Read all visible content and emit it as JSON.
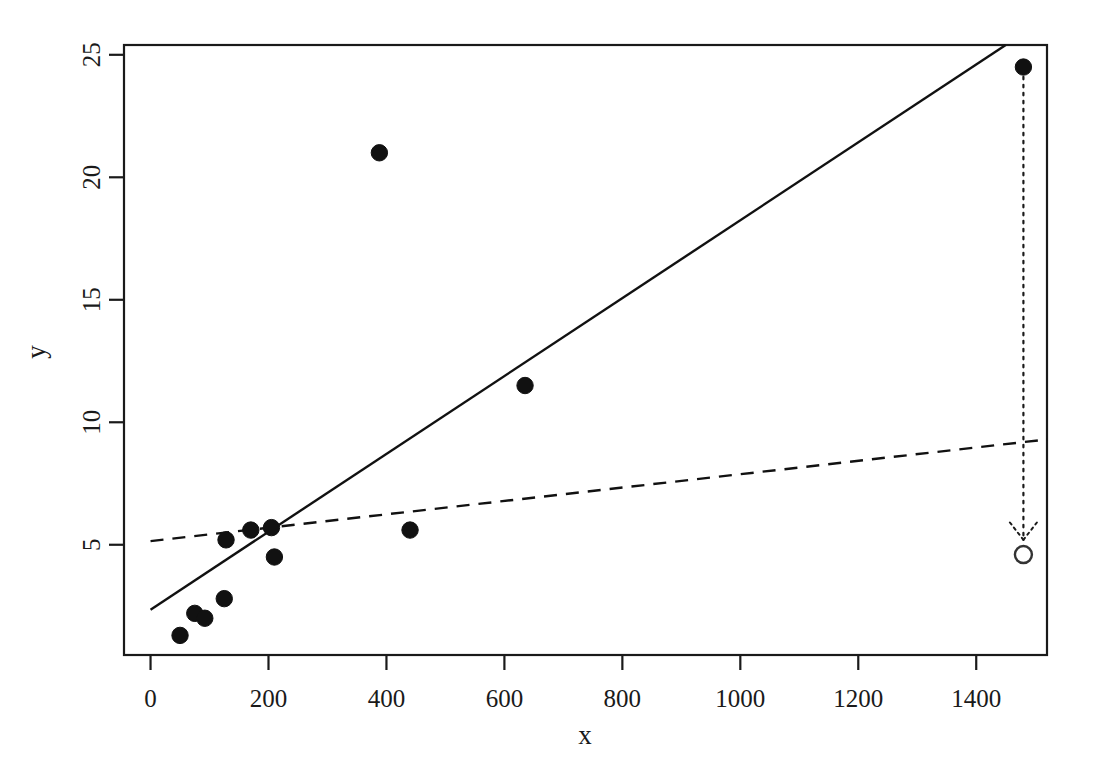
{
  "figure": {
    "kind": "scatter-plot-with-regression-lines",
    "background_color": "#ffffff",
    "foreground_color": "#1a1a1a",
    "width": 1096,
    "height": 777
  },
  "axes": {
    "x_label": "x",
    "y_label": "y",
    "x_ticks": [
      "0",
      "200",
      "400",
      "600",
      "800",
      "1000",
      "1200",
      "1400"
    ],
    "y_ticks": [
      "5",
      "10",
      "15",
      "20",
      "25"
    ],
    "box": true,
    "grid": false
  },
  "chart_data": {
    "type": "scatter",
    "title": "",
    "xlabel": "x",
    "ylabel": "y",
    "xlim": [
      -45,
      1520
    ],
    "ylim": [
      0.5,
      25.4
    ],
    "xticks": [
      0,
      200,
      400,
      600,
      800,
      1000,
      1200,
      1400
    ],
    "yticks": [
      5,
      10,
      15,
      20,
      25
    ],
    "grid": false,
    "legend": "none",
    "series": [
      {
        "name": "observations",
        "marker": "filled-circle",
        "color": "#111111",
        "points": [
          {
            "x": 50,
            "y": 1.3
          },
          {
            "x": 75,
            "y": 2.2
          },
          {
            "x": 92,
            "y": 2.0
          },
          {
            "x": 125,
            "y": 2.8
          },
          {
            "x": 128,
            "y": 5.2
          },
          {
            "x": 170,
            "y": 5.6
          },
          {
            "x": 205,
            "y": 5.7
          },
          {
            "x": 210,
            "y": 4.5
          },
          {
            "x": 388,
            "y": 21.0
          },
          {
            "x": 440,
            "y": 5.6
          },
          {
            "x": 635,
            "y": 11.5
          },
          {
            "x": 1480,
            "y": 24.5
          }
        ]
      },
      {
        "name": "moved-point",
        "marker": "open-circle",
        "color": "#333333",
        "points": [
          {
            "x": 1480,
            "y": 4.6
          }
        ]
      }
    ],
    "lines": [
      {
        "name": "solid-regression-line",
        "style": "solid",
        "color": "#111111",
        "x0": 0,
        "y0": 2.35,
        "x1": 1450,
        "y1": 25.4
      },
      {
        "name": "dashed-regression-line",
        "style": "dashed",
        "color": "#111111",
        "x0": 0,
        "y0": 5.15,
        "x1": 1520,
        "y1": 9.3
      }
    ],
    "annotations": [
      {
        "name": "leverage-arrow",
        "style": "dotted-arrow",
        "from": {
          "x": 1480,
          "y": 24.1
        },
        "to": {
          "x": 1480,
          "y": 5.2
        },
        "label": ""
      }
    ]
  }
}
